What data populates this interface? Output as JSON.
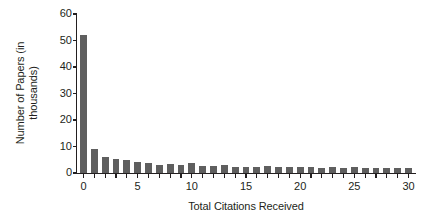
{
  "chart_data": {
    "type": "bar",
    "title": "",
    "xlabel": "Total Citations Received",
    "ylabel": "Number of Papers (in\nthousands)",
    "categories": [
      0,
      1,
      2,
      3,
      4,
      5,
      6,
      7,
      8,
      9,
      10,
      11,
      12,
      13,
      14,
      15,
      16,
      17,
      18,
      19,
      20,
      21,
      22,
      23,
      24,
      25,
      26,
      27,
      28,
      29,
      30
    ],
    "values": [
      52,
      9.2,
      6.2,
      5.2,
      4.9,
      4.0,
      3.9,
      3.2,
      3.3,
      3.1,
      3.8,
      2.6,
      2.6,
      2.9,
      2.3,
      2.4,
      2.4,
      2.5,
      2.3,
      2.2,
      2.3,
      2.2,
      2.0,
      2.1,
      1.9,
      2.1,
      2.0,
      2.0,
      1.8,
      1.8,
      2.0
    ],
    "xlim": [
      -0.6,
      30.6
    ],
    "ylim": [
      0,
      60
    ],
    "ytick_values": [
      0,
      10,
      20,
      30,
      40,
      50,
      60
    ],
    "xtick_labeled": [
      0,
      5,
      10,
      15,
      20,
      25,
      30
    ],
    "xtick_minor_step": 1,
    "grid": false,
    "legend": false,
    "bar_color": "#5f5f5f",
    "axis_color": "#231f20",
    "background_color": "#ffffff"
  }
}
